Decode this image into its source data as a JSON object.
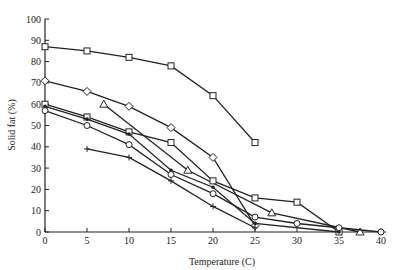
{
  "chart_data": {
    "type": "line",
    "title": "",
    "xlabel": "Temperature (C)",
    "ylabel": "Solid fat (%)",
    "xlim": [
      0,
      40
    ],
    "ylim": [
      0,
      100
    ],
    "xticks": [
      0,
      5,
      10,
      15,
      20,
      25,
      30,
      35,
      40
    ],
    "yticks": [
      0,
      10,
      20,
      30,
      40,
      50,
      60,
      70,
      80,
      90,
      100
    ],
    "grid": false,
    "legend": "none",
    "series": [
      {
        "name": "Series 1",
        "marker": "square",
        "x": [
          0,
          5,
          10,
          15,
          20,
          25
        ],
        "y": [
          87,
          85,
          82,
          78,
          64,
          42
        ]
      },
      {
        "name": "Series 2",
        "marker": "diamond",
        "x": [
          0,
          5,
          10,
          15,
          20,
          25
        ],
        "y": [
          71,
          66,
          59,
          49,
          35,
          3
        ]
      },
      {
        "name": "Series 3",
        "marker": "triangle",
        "x": [
          7,
          17,
          27,
          37.5
        ],
        "y": [
          60,
          29,
          9,
          0
        ]
      },
      {
        "name": "Series 4",
        "marker": "square",
        "x": [
          0,
          5,
          10,
          15,
          20,
          25,
          30,
          35
        ],
        "y": [
          60,
          54,
          47,
          42,
          24,
          16,
          14,
          0
        ]
      },
      {
        "name": "Series 5",
        "marker": "dot",
        "x": [
          0,
          5,
          10,
          15,
          20,
          25,
          35
        ],
        "y": [
          59,
          53,
          46,
          29,
          21,
          4,
          0
        ]
      },
      {
        "name": "Series 6",
        "marker": "circle",
        "x": [
          0,
          5,
          10,
          15,
          20,
          25,
          30,
          35,
          40
        ],
        "y": [
          57,
          50,
          41,
          27,
          18,
          7,
          4,
          2,
          0
        ]
      },
      {
        "name": "Series 7",
        "marker": "plus",
        "x": [
          5,
          10,
          15,
          20,
          25
        ],
        "y": [
          39,
          35,
          24,
          12,
          2
        ]
      }
    ]
  }
}
